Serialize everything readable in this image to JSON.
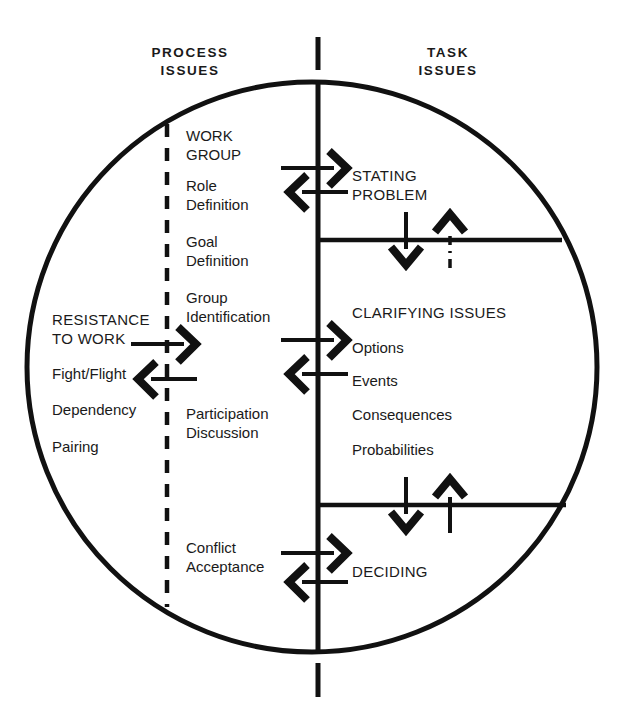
{
  "headers": {
    "left": "PROCESS\nISSUES",
    "right": "TASK\nISSUES"
  },
  "process_column": {
    "items": [
      {
        "text": "WORK\nGROUP",
        "x": 186,
        "y": 126
      },
      {
        "text": "Role\nDefinition",
        "x": 186,
        "y": 176
      },
      {
        "text": "Goal\nDefinition",
        "x": 186,
        "y": 232
      },
      {
        "text": "Group\nIdentification",
        "x": 186,
        "y": 288
      },
      {
        "text": "Participation\nDiscussion",
        "x": 186,
        "y": 404
      },
      {
        "text": "Conflict\nAcceptance",
        "x": 186,
        "y": 538
      }
    ]
  },
  "resistance_column": {
    "items": [
      {
        "text": "RESISTANCE\nTO WORK",
        "x": 52,
        "y": 310
      },
      {
        "text": "Fight/Flight",
        "x": 52,
        "y": 364
      },
      {
        "text": "Dependency",
        "x": 52,
        "y": 400
      },
      {
        "text": "Pairing",
        "x": 52,
        "y": 437
      }
    ]
  },
  "task_column": {
    "items": [
      {
        "text": "STATING\nPROBLEM",
        "x": 352,
        "y": 166
      },
      {
        "text": "CLARIFYING ISSUES",
        "x": 352,
        "y": 303
      },
      {
        "text": "Options",
        "x": 352,
        "y": 338
      },
      {
        "text": "Events",
        "x": 352,
        "y": 371
      },
      {
        "text": "Consequences",
        "x": 352,
        "y": 405
      },
      {
        "text": "Probabilities",
        "x": 352,
        "y": 440
      },
      {
        "text": "DECIDING",
        "x": 352,
        "y": 562
      }
    ]
  },
  "colors": {
    "ink": "#111111",
    "background": "#ffffff"
  },
  "geometry": {
    "circle": {
      "cx": 312,
      "cy": 367,
      "rx": 285,
      "ry": 285
    },
    "center_axis_x": 318,
    "dashed_axis_x": 167,
    "divider_1_y": 240,
    "divider_2_y": 505
  }
}
